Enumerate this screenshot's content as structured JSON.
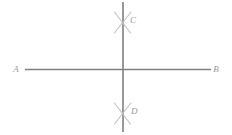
{
  "diagram": {
    "background_color": "#ffffff",
    "line_color": "#808080",
    "arc_color": "#c0c0c0",
    "label_color": "#9a9a9a",
    "labels": {
      "a": "A",
      "b": "B",
      "c": "C",
      "d": "D"
    },
    "geometry": {
      "horizontal_line": {
        "name": "line-AB",
        "x1": 25,
        "y1": 69.5,
        "x2": 211,
        "y2": 69.5,
        "stroke_width": 1.6
      },
      "vertical_line": {
        "name": "line-CD",
        "x1": 123,
        "y1": 2,
        "x2": 123,
        "y2": 132,
        "stroke_width": 1.6
      },
      "intersection": {
        "x": 123,
        "y": 69.5
      },
      "arc_mark_top": {
        "name": "arc-mark-C",
        "center_x": 123,
        "center_y": 22,
        "stroke_width": 1.1
      },
      "arc_mark_bottom": {
        "name": "arc-mark-D",
        "center_x": 123,
        "center_y": 113,
        "stroke_width": 1.1
      },
      "label_positions": {
        "a": {
          "x": 16,
          "y": 70
        },
        "b": {
          "x": 215,
          "y": 70
        },
        "c": {
          "x": 130,
          "y": 21
        },
        "d": {
          "x": 131,
          "y": 112
        }
      }
    }
  }
}
